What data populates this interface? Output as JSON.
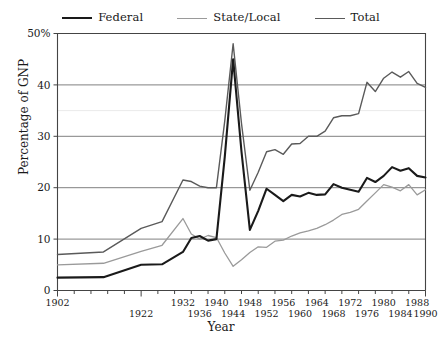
{
  "chart_data": {
    "type": "line",
    "title": "",
    "xlabel": "Year",
    "ylabel": "Percentage of GNP",
    "xlim": [
      1902,
      1990
    ],
    "ylim": [
      0,
      50
    ],
    "yticks": [
      0,
      10,
      20,
      30,
      40,
      50
    ],
    "ytick_labels": [
      "0",
      "10",
      "20",
      "30",
      "40",
      "50%"
    ],
    "grid": "horizontal",
    "legend_position": "top-center",
    "xtick_years": [
      1902,
      1906,
      1910,
      1914,
      1918,
      1922,
      1926,
      1930,
      1932,
      1936,
      1940,
      1944,
      1948,
      1952,
      1956,
      1960,
      1964,
      1968,
      1972,
      1976,
      1980,
      1984,
      1988,
      1990
    ],
    "xtick_labels_upper": [
      "1902",
      "1932",
      "1940",
      "1948",
      "1956",
      "1964",
      "1972",
      "1980",
      "1988"
    ],
    "xtick_labels_lower": [
      "1922",
      "1936",
      "1944",
      "1952",
      "1960",
      "1968",
      "1976",
      "1984",
      "1990"
    ],
    "x": [
      1902,
      1913,
      1922,
      1927,
      1932,
      1934,
      1936,
      1938,
      1940,
      1942,
      1944,
      1946,
      1948,
      1950,
      1952,
      1954,
      1956,
      1958,
      1960,
      1962,
      1964,
      1966,
      1968,
      1970,
      1972,
      1974,
      1976,
      1978,
      1980,
      1982,
      1984,
      1986,
      1988,
      1990
    ],
    "series": [
      {
        "name": "Federal",
        "color": "#1a1a1a",
        "values": [
          2.5,
          2.6,
          5.0,
          5.1,
          7.5,
          10.2,
          10.6,
          9.7,
          10.0,
          26.0,
          45.0,
          27.0,
          11.8,
          15.5,
          19.8,
          18.6,
          17.4,
          18.6,
          18.3,
          19.0,
          18.6,
          18.7,
          20.7,
          20.0,
          19.6,
          19.2,
          21.9,
          21.1,
          22.3,
          24.0,
          23.3,
          23.8,
          22.3,
          22.0
        ]
      },
      {
        "name": "State/Local",
        "color": "#9a9a9a",
        "values": [
          5.0,
          5.3,
          7.6,
          8.8,
          14.0,
          11.0,
          10.0,
          10.7,
          10.3,
          7.3,
          4.7,
          6.0,
          7.4,
          8.5,
          8.4,
          9.6,
          9.8,
          10.6,
          11.2,
          11.6,
          12.1,
          12.8,
          13.7,
          14.8,
          15.2,
          15.8,
          17.4,
          19.0,
          20.6,
          20.1,
          19.4,
          20.6,
          18.6,
          19.6
        ]
      },
      {
        "name": "Total",
        "color": "#5a5a5a",
        "values": [
          7.0,
          7.5,
          12.1,
          13.4,
          21.5,
          21.2,
          20.3,
          20.0,
          20.0,
          33.0,
          48.0,
          32.5,
          19.5,
          23.0,
          27.0,
          27.4,
          26.5,
          28.5,
          28.6,
          30.0,
          30.0,
          31.0,
          33.6,
          34.0,
          34.0,
          34.4,
          40.5,
          38.7,
          41.3,
          42.5,
          41.5,
          42.6,
          40.3,
          39.5
        ]
      }
    ]
  }
}
